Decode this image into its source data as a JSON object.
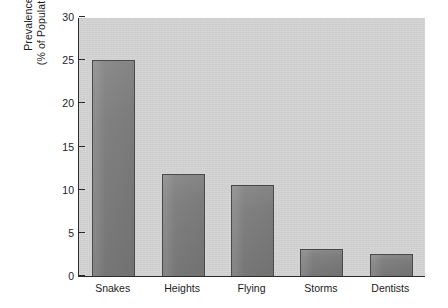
{
  "chart_data": {
    "type": "bar",
    "title": "",
    "subtitle": "",
    "xlabel": "",
    "ylabel": "Prevalence (% of Population)",
    "ylabel_lines": [
      "Prevalence",
      "(% of Population)"
    ],
    "categories": [
      "Snakes",
      "Heights",
      "Flying",
      "Storms",
      "Dentists"
    ],
    "values": [
      25.0,
      11.8,
      10.6,
      3.1,
      2.6
    ],
    "ylim": [
      0,
      30
    ],
    "xlim": [
      0,
      5
    ],
    "y_ticks": [
      0,
      5,
      10,
      15,
      20,
      25,
      30
    ],
    "y_tick_labels": [
      "0",
      "5",
      "10",
      "15",
      "20",
      "25",
      "30"
    ],
    "grid": false,
    "legend": false,
    "legend_position": "none",
    "series": [
      {
        "name": "Prevalence",
        "values": [
          25.0,
          11.8,
          10.6,
          3.1,
          2.6
        ]
      }
    ]
  },
  "style": {
    "page_background": "#ffffff",
    "panel_background": "#d4d4d4",
    "bar_fill": "#808080",
    "bar_edge": "#4a4a4a",
    "axis_color": "#2b2b2b",
    "text_color": "#1c1c1c"
  }
}
